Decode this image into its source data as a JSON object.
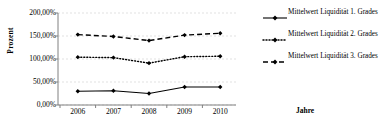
{
  "chart_data": {
    "type": "line",
    "title": "",
    "xlabel": "Jahre",
    "ylabel": "Prozent",
    "categories": [
      "2006",
      "2007",
      "2008",
      "2009",
      "2010"
    ],
    "ylim": [
      0,
      200
    ],
    "yticks": [
      0,
      50,
      100,
      150,
      200
    ],
    "ytick_labels": [
      "0,00%",
      "50,00%",
      "100,00%",
      "150,00%",
      "200,00%"
    ],
    "grid": true,
    "legend_position": "right",
    "series": [
      {
        "name": "Mittelwert Liquidität 1. Grades",
        "values": [
          30,
          31,
          25,
          39,
          39
        ],
        "line_style": "solid",
        "marker": "diamond",
        "color": "#000000"
      },
      {
        "name": "Mittelwert Liquidität 2. Grades",
        "values": [
          104,
          103,
          91,
          105,
          106
        ],
        "line_style": "dotted",
        "marker": "diamond",
        "color": "#000000"
      },
      {
        "name": "Mittelwert Liquidität 3. Grades",
        "values": [
          153,
          149,
          140,
          152,
          156
        ],
        "line_style": "dashed",
        "marker": "diamond",
        "color": "#000000"
      }
    ]
  },
  "axes": {
    "y_title": "Prozent",
    "x_title": "Jahre"
  },
  "legend": {
    "entries": [
      {
        "label": "Mittelwert Liquidität 1. Grades"
      },
      {
        "label": "Mittelwert Liquidität 2. Grades"
      },
      {
        "label": "Mittelwert Liquidität 3. Grades"
      }
    ]
  },
  "colors": {
    "series": "#000000",
    "axis": "#808080",
    "grid": "#d9d9d9",
    "background": "#ffffff"
  }
}
